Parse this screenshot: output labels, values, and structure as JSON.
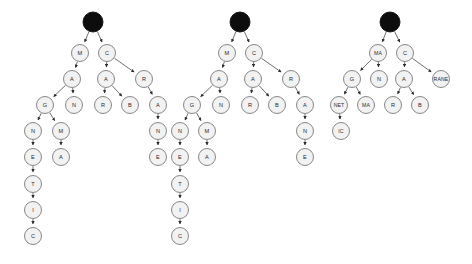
{
  "diagram": {
    "background_color": "#ffffff",
    "node_fill": "#f2f2f2",
    "node_stroke": "#7a7a7a",
    "root_fill": "#0d0d0d",
    "edge_color": "#4a4a4a",
    "node_radius": 8.5,
    "root_radius": 10,
    "trees": [
      {
        "name": "tree-1",
        "nodes": [
          {
            "id": "t1-root",
            "label": "",
            "x": 93,
            "y": 22,
            "root": true
          },
          {
            "id": "t1-m",
            "label": "M",
            "x": 80,
            "y": 53
          },
          {
            "id": "t1-c",
            "label": "C",
            "x": 107,
            "y": 53
          },
          {
            "id": "t1-a1",
            "label": "A",
            "x": 72,
            "y": 79
          },
          {
            "id": "t1-a2",
            "label": "A",
            "x": 106,
            "y": 79
          },
          {
            "id": "t1-r1",
            "label": "R",
            "x": 144,
            "y": 79
          },
          {
            "id": "t1-g",
            "label": "G",
            "x": 45,
            "y": 105
          },
          {
            "id": "t1-n1",
            "label": "N",
            "x": 74,
            "y": 105
          },
          {
            "id": "t1-r2",
            "label": "R",
            "x": 103,
            "y": 105
          },
          {
            "id": "t1-b",
            "label": "B",
            "x": 130,
            "y": 105
          },
          {
            "id": "t1-a3",
            "label": "A",
            "x": 158,
            "y": 105
          },
          {
            "id": "t1-n2",
            "label": "N",
            "x": 33,
            "y": 131
          },
          {
            "id": "t1-m2",
            "label": "M",
            "x": 61,
            "y": 131
          },
          {
            "id": "t1-n3",
            "label": "N",
            "x": 158,
            "y": 131
          },
          {
            "id": "t1-e1",
            "label": "E",
            "x": 33,
            "y": 157
          },
          {
            "id": "t1-a4",
            "label": "A",
            "x": 61,
            "y": 157
          },
          {
            "id": "t1-e2",
            "label": "E",
            "x": 158,
            "y": 157
          },
          {
            "id": "t1-t",
            "label": "T",
            "x": 33,
            "y": 184
          },
          {
            "id": "t1-i",
            "label": "I",
            "x": 33,
            "y": 210
          },
          {
            "id": "t1-c2",
            "label": "C",
            "x": 33,
            "y": 236
          }
        ],
        "edges": [
          [
            "t1-root",
            "t1-m"
          ],
          [
            "t1-root",
            "t1-c"
          ],
          [
            "t1-m",
            "t1-a1"
          ],
          [
            "t1-c",
            "t1-a2"
          ],
          [
            "t1-c",
            "t1-r1"
          ],
          [
            "t1-a1",
            "t1-g"
          ],
          [
            "t1-a1",
            "t1-n1"
          ],
          [
            "t1-a2",
            "t1-r2"
          ],
          [
            "t1-a2",
            "t1-b"
          ],
          [
            "t1-r1",
            "t1-a3"
          ],
          [
            "t1-g",
            "t1-n2"
          ],
          [
            "t1-g",
            "t1-m2"
          ],
          [
            "t1-a3",
            "t1-n3"
          ],
          [
            "t1-n2",
            "t1-e1"
          ],
          [
            "t1-m2",
            "t1-a4"
          ],
          [
            "t1-n3",
            "t1-e2"
          ],
          [
            "t1-e1",
            "t1-t"
          ],
          [
            "t1-t",
            "t1-i"
          ],
          [
            "t1-i",
            "t1-c2"
          ]
        ]
      },
      {
        "name": "tree-2",
        "nodes": [
          {
            "id": "t2-root",
            "label": "",
            "x": 240,
            "y": 22,
            "root": true
          },
          {
            "id": "t2-m",
            "label": "M",
            "x": 227,
            "y": 53
          },
          {
            "id": "t2-c",
            "label": "C",
            "x": 254,
            "y": 53
          },
          {
            "id": "t2-a1",
            "label": "A",
            "x": 219,
            "y": 79
          },
          {
            "id": "t2-a2",
            "label": "A",
            "x": 253,
            "y": 79
          },
          {
            "id": "t2-r1",
            "label": "R",
            "x": 291,
            "y": 79
          },
          {
            "id": "t2-g",
            "label": "G",
            "x": 192,
            "y": 105
          },
          {
            "id": "t2-n1",
            "label": "N",
            "x": 221,
            "y": 105
          },
          {
            "id": "t2-r2",
            "label": "R",
            "x": 250,
            "y": 105
          },
          {
            "id": "t2-b",
            "label": "B",
            "x": 277,
            "y": 105
          },
          {
            "id": "t2-a3",
            "label": "A",
            "x": 305,
            "y": 105
          },
          {
            "id": "t2-n2",
            "label": "N",
            "x": 180,
            "y": 131
          },
          {
            "id": "t2-m2",
            "label": "M",
            "x": 207,
            "y": 131
          },
          {
            "id": "t2-n3",
            "label": "N",
            "x": 305,
            "y": 131
          },
          {
            "id": "t2-e1",
            "label": "E",
            "x": 180,
            "y": 157
          },
          {
            "id": "t2-a4",
            "label": "A",
            "x": 207,
            "y": 157
          },
          {
            "id": "t2-e2",
            "label": "E",
            "x": 305,
            "y": 157
          },
          {
            "id": "t2-t",
            "label": "T",
            "x": 180,
            "y": 184
          },
          {
            "id": "t2-i",
            "label": "I",
            "x": 180,
            "y": 210
          },
          {
            "id": "t2-c2",
            "label": "C",
            "x": 180,
            "y": 236
          }
        ],
        "edges": [
          [
            "t2-root",
            "t2-m"
          ],
          [
            "t2-root",
            "t2-c"
          ],
          [
            "t2-m",
            "t2-a1"
          ],
          [
            "t2-c",
            "t2-a2"
          ],
          [
            "t2-c",
            "t2-r1"
          ],
          [
            "t2-a1",
            "t2-g"
          ],
          [
            "t2-a1",
            "t2-n1"
          ],
          [
            "t2-a2",
            "t2-r2"
          ],
          [
            "t2-a2",
            "t2-b"
          ],
          [
            "t2-r1",
            "t2-a3"
          ],
          [
            "t2-g",
            "t2-n2"
          ],
          [
            "t2-g",
            "t2-m2"
          ],
          [
            "t2-a3",
            "t2-n3"
          ],
          [
            "t2-n2",
            "t2-e1"
          ],
          [
            "t2-m2",
            "t2-a4"
          ],
          [
            "t2-n3",
            "t2-e2"
          ],
          [
            "t2-e1",
            "t2-t"
          ],
          [
            "t2-t",
            "t2-i"
          ],
          [
            "t2-i",
            "t2-c2"
          ]
        ]
      },
      {
        "name": "tree-3",
        "nodes": [
          {
            "id": "t3-root",
            "label": "",
            "x": 390,
            "y": 22,
            "root": true
          },
          {
            "id": "t3-ma1",
            "label": "MA",
            "x": 378,
            "y": 53,
            "wide": true
          },
          {
            "id": "t3-c",
            "label": "C",
            "x": 405,
            "y": 53
          },
          {
            "id": "t3-g",
            "label": "G",
            "x": 352,
            "y": 79
          },
          {
            "id": "t3-n",
            "label": "N",
            "x": 379,
            "y": 79
          },
          {
            "id": "t3-a",
            "label": "A",
            "x": 404,
            "y": 79
          },
          {
            "id": "t3-rane",
            "label": "RANE",
            "x": 441,
            "y": 79,
            "wide": true
          },
          {
            "id": "t3-net",
            "label": "NET",
            "x": 339,
            "y": 105,
            "wide": true
          },
          {
            "id": "t3-ma2",
            "label": "MA",
            "x": 366,
            "y": 105,
            "wide": true
          },
          {
            "id": "t3-r",
            "label": "R",
            "x": 393,
            "y": 105
          },
          {
            "id": "t3-b",
            "label": "B",
            "x": 420,
            "y": 105
          },
          {
            "id": "t3-ic",
            "label": "IC",
            "x": 341,
            "y": 131,
            "wide": true
          }
        ],
        "edges": [
          [
            "t3-root",
            "t3-ma1"
          ],
          [
            "t3-root",
            "t3-c"
          ],
          [
            "t3-ma1",
            "t3-g"
          ],
          [
            "t3-ma1",
            "t3-n"
          ],
          [
            "t3-c",
            "t3-a"
          ],
          [
            "t3-c",
            "t3-rane"
          ],
          [
            "t3-g",
            "t3-net"
          ],
          [
            "t3-g",
            "t3-ma2"
          ],
          [
            "t3-a",
            "t3-r"
          ],
          [
            "t3-a",
            "t3-b"
          ],
          [
            "t3-net",
            "t3-ic"
          ]
        ]
      }
    ]
  }
}
